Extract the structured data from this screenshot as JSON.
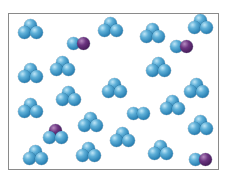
{
  "diagram": {
    "colors": {
      "blue_atom": "#3a8fc2",
      "purple_atom": "#5a2a6e",
      "frame": "#8a8a8a"
    },
    "molecules": [
      {
        "type": "triatomic",
        "x": 30,
        "y": 29,
        "atoms": [
          "blue",
          "blue",
          "blue"
        ]
      },
      {
        "type": "diatomic",
        "x": 78,
        "y": 43,
        "atoms": [
          "blue",
          "purple"
        ]
      },
      {
        "type": "triatomic",
        "x": 110,
        "y": 27,
        "atoms": [
          "blue",
          "blue",
          "blue"
        ]
      },
      {
        "type": "triatomic",
        "x": 152,
        "y": 33,
        "atoms": [
          "blue",
          "blue",
          "blue"
        ]
      },
      {
        "type": "diatomic",
        "x": 181,
        "y": 46,
        "atoms": [
          "blue",
          "purple"
        ]
      },
      {
        "type": "triatomic",
        "x": 200,
        "y": 24,
        "atoms": [
          "blue",
          "blue",
          "blue"
        ]
      },
      {
        "type": "triatomic",
        "x": 30,
        "y": 73,
        "atoms": [
          "blue",
          "blue",
          "blue"
        ]
      },
      {
        "type": "triatomic",
        "x": 62,
        "y": 66,
        "atoms": [
          "blue",
          "blue",
          "blue"
        ]
      },
      {
        "type": "triatomic",
        "x": 114,
        "y": 88,
        "atoms": [
          "blue",
          "blue",
          "blue"
        ]
      },
      {
        "type": "triatomic",
        "x": 158,
        "y": 67,
        "atoms": [
          "blue",
          "blue",
          "blue"
        ]
      },
      {
        "type": "triatomic",
        "x": 196,
        "y": 88,
        "atoms": [
          "blue",
          "blue",
          "blue"
        ]
      },
      {
        "type": "triatomic",
        "x": 30,
        "y": 108,
        "atoms": [
          "blue",
          "blue",
          "blue"
        ]
      },
      {
        "type": "triatomic",
        "x": 68,
        "y": 96,
        "atoms": [
          "blue",
          "blue",
          "blue"
        ]
      },
      {
        "type": "diatomic",
        "x": 138,
        "y": 113,
        "atoms": [
          "blue",
          "blue"
        ]
      },
      {
        "type": "triatomic",
        "x": 172,
        "y": 105,
        "atoms": [
          "blue",
          "blue",
          "blue"
        ]
      },
      {
        "type": "triatomic",
        "x": 55,
        "y": 134,
        "atoms": [
          "purple",
          "blue",
          "blue"
        ]
      },
      {
        "type": "triatomic",
        "x": 90,
        "y": 122,
        "atoms": [
          "blue",
          "blue",
          "blue"
        ]
      },
      {
        "type": "triatomic",
        "x": 122,
        "y": 137,
        "atoms": [
          "blue",
          "blue",
          "blue"
        ]
      },
      {
        "type": "triatomic",
        "x": 200,
        "y": 125,
        "atoms": [
          "blue",
          "blue",
          "blue"
        ]
      },
      {
        "type": "triatomic",
        "x": 35,
        "y": 155,
        "atoms": [
          "blue",
          "blue",
          "blue"
        ]
      },
      {
        "type": "triatomic",
        "x": 88,
        "y": 152,
        "atoms": [
          "blue",
          "blue",
          "blue"
        ]
      },
      {
        "type": "triatomic",
        "x": 160,
        "y": 150,
        "atoms": [
          "blue",
          "blue",
          "blue"
        ]
      },
      {
        "type": "diatomic",
        "x": 200,
        "y": 159,
        "atoms": [
          "blue",
          "purple"
        ]
      }
    ]
  }
}
